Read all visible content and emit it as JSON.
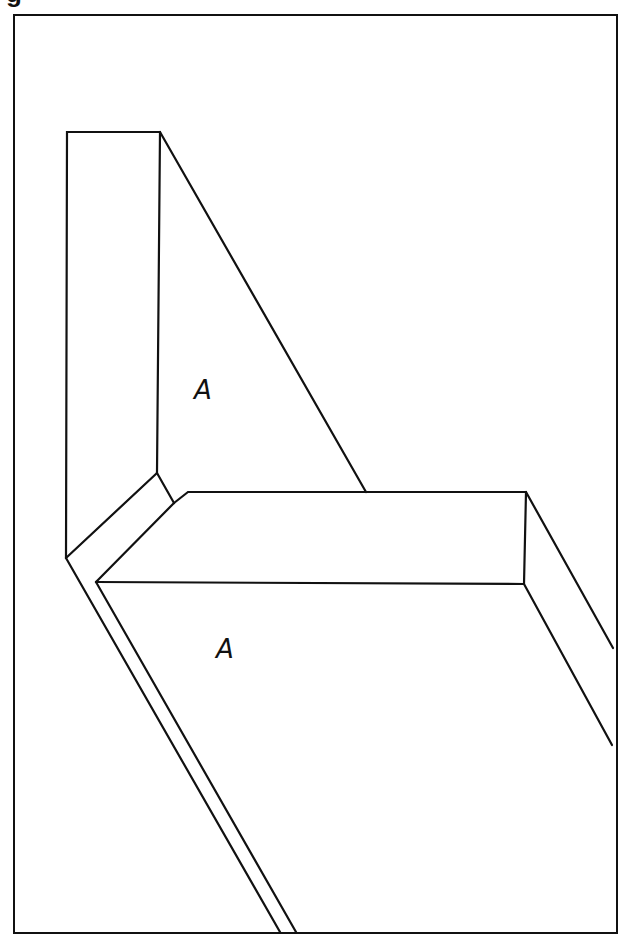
{
  "figure": {
    "caption_partial": "g",
    "stroke_color": "#111111",
    "background": "#ffffff",
    "frame": {
      "x": 14,
      "y": 15,
      "width": 603,
      "height": 918
    }
  },
  "labels": [
    {
      "text": "A",
      "region": "upright-panel-face",
      "x": 194,
      "y": 377
    },
    {
      "text": "A",
      "region": "horizontal-panel-face",
      "x": 216,
      "y": 636
    }
  ]
}
